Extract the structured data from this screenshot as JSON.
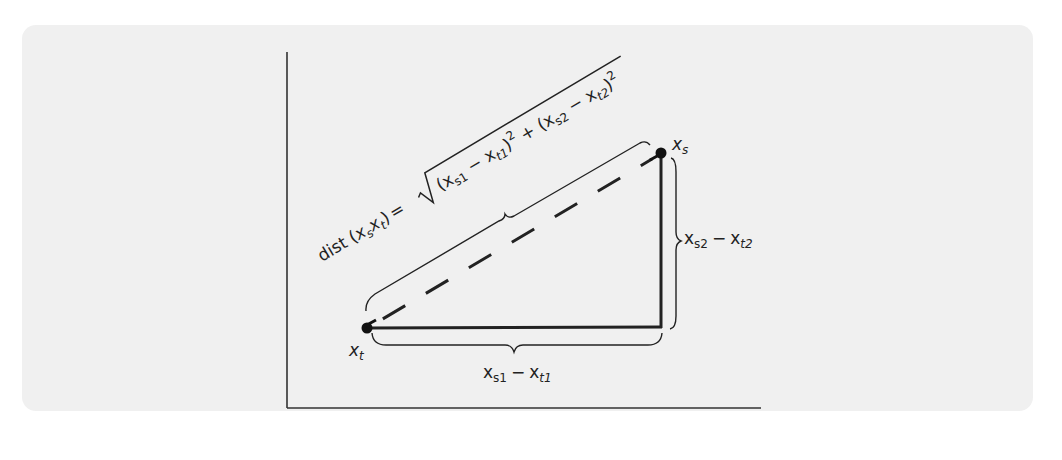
{
  "figure": {
    "type": "euclidean-distance-diagram",
    "background_color": "#f0f0f0",
    "ink_color": "#222222",
    "points": {
      "target": {
        "name": "x",
        "sub": "t",
        "pos": [
          367,
          328
        ]
      },
      "source": {
        "name": "x",
        "sub": "s",
        "pos": [
          661,
          153
        ]
      },
      "corner": {
        "pos": [
          661,
          327
        ]
      }
    },
    "axes": {
      "y_axis": {
        "x": 287,
        "y_top": 52,
        "y_bottom": 408
      },
      "x_axis": {
        "y": 408,
        "x_left": 287,
        "x_right": 760
      }
    },
    "labels": {
      "target_point": {
        "base": "x",
        "sub": "t"
      },
      "source_point": {
        "base": "x",
        "sub": "s"
      },
      "horizontal_diff": {
        "a": "x",
        "a_sub": "s1",
        "op": "−",
        "b": "x",
        "b_sub": "t1"
      },
      "vertical_diff": {
        "a": "x",
        "a_sub": "s2",
        "op": "−",
        "b": "x",
        "b_sub": "t2"
      },
      "formula": {
        "lhs_func": "dist",
        "lhs_open": "(",
        "lhs_a": "x",
        "lhs_a_sub": "s",
        "lhs_b": "x",
        "lhs_b_sub": "t",
        "lhs_close": ")",
        "equals": "=",
        "term1_open": "(x",
        "term1_a_sub": "s1",
        "term1_minus": " − x",
        "term1_b_sub": "t1",
        "term1_close": ")",
        "sup1": "2",
        "plus": " + ",
        "term2_open": "(x",
        "term2_a_sub": "s2",
        "term2_minus": " − x",
        "term2_b_sub": "t2",
        "term2_close": ")",
        "sup2": "2",
        "text": "dist (x_s x_t) = √((x_s1 − x_t1)² + (x_s2 − x_t2)²)"
      }
    }
  }
}
